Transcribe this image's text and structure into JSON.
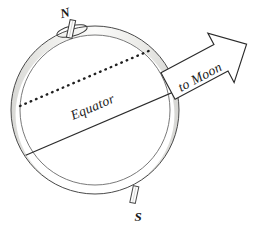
{
  "diagram": {
    "labels": {
      "north_pole": "N",
      "south_pole": "S",
      "equator": "Equator",
      "to_moon": "to Moon"
    },
    "colors": {
      "background": "#ffffff",
      "outline": "#4a4a4a",
      "line_dark": "#2b2b2b",
      "rim_fill": "#e8e8e6",
      "rim_fill_light": "#f4f4f2",
      "text": "#1a1a1a",
      "arrow_fill": "#ffffff"
    },
    "geometry": {
      "globe_center_x": 95,
      "globe_center_y": 110,
      "globe_radius": 84,
      "rim_band_width": 9,
      "equator_tilt_deg": -23,
      "orbit_plane_tilt_deg": -23,
      "arrow_angle_deg": -28
    },
    "elements": {
      "globe": "earth-sphere",
      "rim": "sphere-rim-band",
      "equator_line": "equator-line",
      "orbital_plane_line": "moon-orbital-plane-dotted-line",
      "north_axis_stub": "north-polar-axis-rod",
      "south_axis_stub": "south-polar-axis-rod",
      "rotation_indicator": "rotation-ellipse",
      "moon_arrow": "to-moon-arrow"
    }
  }
}
